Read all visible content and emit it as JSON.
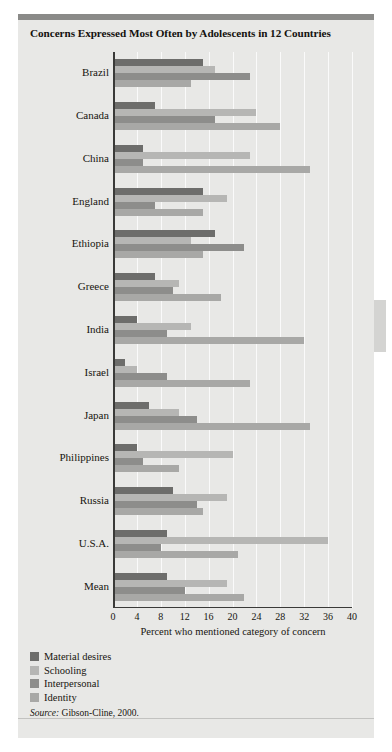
{
  "figure": {
    "title": "Concerns Expressed Most Often by Adolescents in 12 Countries",
    "source_label": "Source:",
    "source_text": "Gibson-Cline, 2000.",
    "background_color": "#e8e8e6",
    "page_color": "#ffffff"
  },
  "chart_data": {
    "type": "bar",
    "orientation": "horizontal",
    "title": "Concerns Expressed Most Often by Adolescents in 12 Countries",
    "xlabel": "Percent who mentioned category of concern",
    "ylabel": "",
    "xlim": [
      0,
      40
    ],
    "xticks": [
      0,
      4,
      8,
      12,
      16,
      20,
      24,
      28,
      32,
      36,
      40
    ],
    "grid": true,
    "grid_axis": "x",
    "legend_position": "below-left",
    "categories": [
      "Brazil",
      "Canada",
      "China",
      "England",
      "Ethiopia",
      "Greece",
      "India",
      "Israel",
      "Japan",
      "Philippines",
      "Russia",
      "U.S.A.",
      "Mean"
    ],
    "series": [
      {
        "name": "Material desires",
        "color": "#6d6d6b",
        "values": [
          15,
          7,
          5,
          15,
          17,
          7,
          4,
          2,
          6,
          4,
          10,
          9,
          9
        ]
      },
      {
        "name": "Schooling",
        "color": "#b6b6b4",
        "values": [
          17,
          24,
          23,
          19,
          13,
          11,
          13,
          4,
          11,
          20,
          19,
          36,
          19
        ]
      },
      {
        "name": "Interpersonal",
        "color": "#8d8d8b",
        "values": [
          23,
          17,
          5,
          7,
          22,
          10,
          9,
          9,
          14,
          5,
          14,
          8,
          12
        ]
      },
      {
        "name": "Identity",
        "color": "#a8a8a6",
        "values": [
          13,
          28,
          33,
          15,
          15,
          18,
          32,
          23,
          33,
          11,
          15,
          21,
          22
        ]
      }
    ]
  },
  "legend": {
    "items": [
      {
        "label": "Material desires",
        "color": "#6d6d6b"
      },
      {
        "label": "Schooling",
        "color": "#b6b6b4"
      },
      {
        "label": "Interpersonal",
        "color": "#8d8d8b"
      },
      {
        "label": "Identity",
        "color": "#a8a8a6"
      }
    ]
  }
}
